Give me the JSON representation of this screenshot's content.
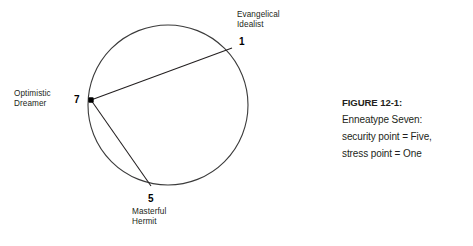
{
  "figure": {
    "domain_kind": "diagram",
    "background_color": "#ffffff",
    "stroke_color": "#3b3b3b",
    "text_color": "#231f20"
  },
  "diagram": {
    "name": "enneagram-circle",
    "circle": {
      "cx": 168,
      "cy": 105,
      "r": 80
    },
    "nodes": [
      {
        "id": "one",
        "number": "1",
        "name": "Evangelical\nIdealist",
        "x": 232,
        "y": 48,
        "marker": "none"
      },
      {
        "id": "seven",
        "number": "7",
        "name": "Optimistic\nDreamer",
        "x": 91,
        "y": 100,
        "marker": "dot"
      },
      {
        "id": "five",
        "number": "5",
        "name": "Masterful\nHermit",
        "x": 151,
        "y": 186,
        "marker": "none"
      }
    ],
    "connections": [
      {
        "id": "seven-to-one",
        "from": "seven",
        "to": "one"
      },
      {
        "id": "seven-to-five",
        "from": "seven",
        "to": "five"
      }
    ]
  },
  "caption": {
    "title": "FIGURE 12-1:",
    "lines": [
      "Enneatype Seven:",
      "security point = Five,",
      "stress point = One"
    ]
  }
}
